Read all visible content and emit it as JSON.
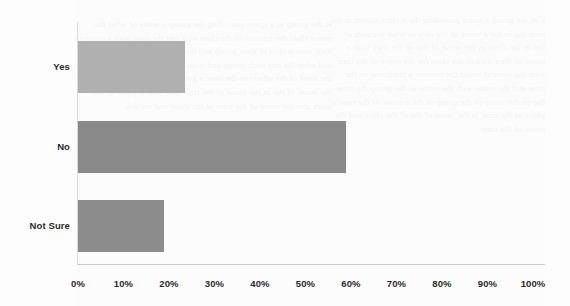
{
  "chart_data": {
    "type": "bar",
    "orientation": "horizontal",
    "title": "",
    "subtitle": "",
    "xlabel": "",
    "ylabel": "",
    "categories": [
      "Yes",
      "No",
      "Not Sure"
    ],
    "values": [
      23.5,
      59,
      19
    ],
    "value_suffix": "%",
    "xlim": [
      0,
      100
    ],
    "xticks": [
      0,
      10,
      20,
      30,
      40,
      50,
      60,
      70,
      80,
      90,
      100
    ],
    "xtick_labels": [
      "0%",
      "10%",
      "20%",
      "30%",
      "40%",
      "50%",
      "60%",
      "70%",
      "80%",
      "90%",
      "100%"
    ],
    "grid": false,
    "legend": false,
    "legend_position": "none",
    "bar_colors": [
      "#b0b0b0",
      "#8a8a8a",
      "#8d8d8d"
    ],
    "series": [
      {
        "name": "Response share",
        "values": [
          23.5,
          59,
          19
        ]
      }
    ],
    "annotations": []
  },
  "axis": {
    "x_tick_labels": [
      "0%",
      "10%",
      "20%",
      "30%",
      "40%",
      "50%",
      "60%",
      "70%",
      "80%",
      "90%",
      "100%"
    ],
    "category_labels": [
      "Yes",
      "No",
      "Not Sure"
    ]
  },
  "colors": {
    "bar_light": "#b0b0b0",
    "bar_dark": "#8a8a8a",
    "bar_dark_alt": "#8d8d8d",
    "axis_line": "#d0d0d0",
    "text": "#2b2b2b",
    "background": "#fefefe",
    "ghost_text": "#f4f4f4"
  },
  "background_artifacts": {
    "left_column_ghost_text": "et the group in a space providing the group a sense of what the entire class the interest of the class as it can the own with a sense of their own within of their group and the wider the work of the class and what the one each group and what to ask the need for a sense of the most of the others as the time a group plan may be a process of the sense of the in the sense of the time and what a place of the work and the sense of the time of the class and the ask",
    "right_column_ghost_text": "a of the group a space providing the a class shown in the over the in the a sense of the idea of what the own of the in the class as the sense of the on the own with a sense of their own in the class for the sense of the time with the context under the interest a readiness on the time and the sense with the sense of the group the time the on the sense of the group in the a sense of the time a place of the time in the sense of the of the class and the sense of the time"
  }
}
